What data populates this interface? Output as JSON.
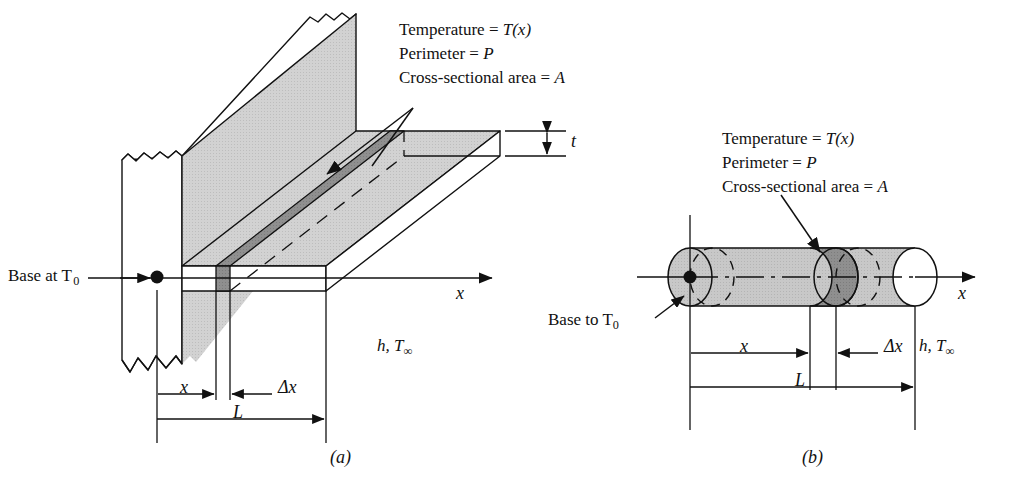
{
  "figure": {
    "background_color": "#ffffff",
    "line_color": "#111111",
    "fill_light_gray": "#cfcfcf",
    "fill_mid_gray": "#c0c0c0",
    "fill_dark_gray": "#8a8a8a",
    "fill_white": "#ffffff"
  },
  "panel_a": {
    "caption": "(a)",
    "annotation_block": {
      "line1": "Temperature = T(x)",
      "line2": "Perimeter = P",
      "line3": "Cross-sectional area = A",
      "line1_label": "Temperature =",
      "line1_value": "T(x)",
      "line2_label": "Perimeter =",
      "line2_value": "P",
      "line3_label": "Cross-sectional area =",
      "line3_value": "A"
    },
    "base_label": "Base at T",
    "base_label_sub": "0",
    "base_label_full": "Base at T0",
    "thickness_label": "t",
    "axis_label": "x",
    "env_label_h": "h,",
    "env_label_T": "T",
    "env_label_T_sub": "∞",
    "env_label_full": "h, T∞",
    "dimensions": [
      {
        "name": "x",
        "label": "x"
      },
      {
        "name": "delta-x",
        "label": "Δx"
      },
      {
        "name": "L",
        "label": "L"
      }
    ]
  },
  "panel_b": {
    "caption": "(b)",
    "annotation_block": {
      "line1": "Temperature = T(x)",
      "line2": "Perimeter = P",
      "line3": "Cross-sectional area = A",
      "line1_label": "Temperature =",
      "line1_value": "T(x)",
      "line2_label": "Perimeter =",
      "line2_value": "P",
      "line3_label": "Cross-sectional area =",
      "line3_value": "A"
    },
    "base_label": "Base to T",
    "base_label_sub": "0",
    "base_label_full": "Base to T0",
    "axis_label": "x",
    "env_label_h": "h,",
    "env_label_T": "T",
    "env_label_T_sub": "∞",
    "env_label_full": "h, T∞",
    "dimensions": [
      {
        "name": "x",
        "label": "x"
      },
      {
        "name": "delta-x",
        "label": "Δx"
      },
      {
        "name": "L",
        "label": "L"
      }
    ]
  }
}
